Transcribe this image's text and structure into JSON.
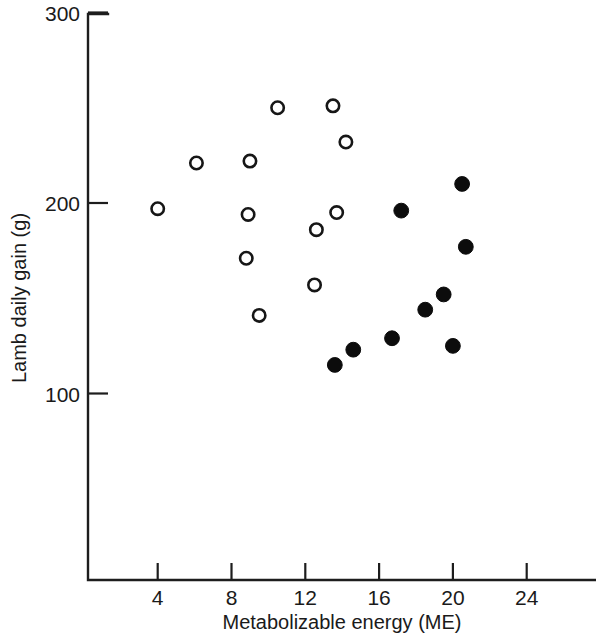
{
  "chart_data": {
    "type": "scatter",
    "title": "",
    "xlabel": "Metabolizable energy (ME)",
    "ylabel": "Lamb daily gain (g)",
    "xlim": [
      0,
      27.8
    ],
    "ylim": [
      0,
      300
    ],
    "xticks": [
      4,
      8,
      12,
      16,
      20,
      24
    ],
    "yticks": [
      100,
      200,
      300
    ],
    "xticklabels": [
      "4",
      "8",
      "12",
      "16",
      "20",
      "24"
    ],
    "yticklabels": [
      "100",
      "200",
      "300"
    ],
    "grid": false,
    "legend": null,
    "series": [
      {
        "name": "open-circles",
        "marker": "open-circle",
        "color": "#161616",
        "points": [
          {
            "x": 4.0,
            "y": 197
          },
          {
            "x": 6.1,
            "y": 221
          },
          {
            "x": 8.8,
            "y": 171
          },
          {
            "x": 8.9,
            "y": 194
          },
          {
            "x": 9.0,
            "y": 222
          },
          {
            "x": 9.5,
            "y": 141
          },
          {
            "x": 10.5,
            "y": 250
          },
          {
            "x": 12.5,
            "y": 157
          },
          {
            "x": 12.6,
            "y": 186
          },
          {
            "x": 13.5,
            "y": 251
          },
          {
            "x": 13.7,
            "y": 195
          },
          {
            "x": 14.2,
            "y": 232
          }
        ]
      },
      {
        "name": "filled-circles",
        "marker": "filled-circle",
        "color": "#0c0c0c",
        "points": [
          {
            "x": 13.6,
            "y": 115
          },
          {
            "x": 14.6,
            "y": 123
          },
          {
            "x": 16.7,
            "y": 129
          },
          {
            "x": 17.2,
            "y": 196
          },
          {
            "x": 18.5,
            "y": 144
          },
          {
            "x": 19.5,
            "y": 152
          },
          {
            "x": 20.0,
            "y": 125
          },
          {
            "x": 20.5,
            "y": 210
          },
          {
            "x": 20.7,
            "y": 177
          }
        ]
      }
    ]
  },
  "figure": {
    "axis": {
      "x_origin_px": 88,
      "y_origin_px": 580,
      "x_top_px": 14,
      "px_per_me": 18.45,
      "me4_px": 157.7,
      "px_per_gain": 1.905,
      "gain200_px": 203
    }
  }
}
